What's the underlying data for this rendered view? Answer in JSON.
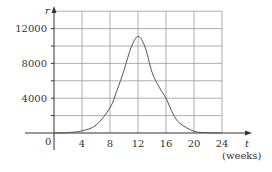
{
  "chart_data": {
    "type": "line",
    "title": "",
    "xlabel": "t",
    "xlabel_unit": "(weeks)",
    "ylabel": "r",
    "xlim": [
      0,
      24
    ],
    "ylim": [
      0,
      14000
    ],
    "x_ticks": [
      4,
      8,
      12,
      16,
      20,
      24
    ],
    "x_tick_labels": [
      "4",
      "8",
      "12",
      "16",
      "20",
      "24"
    ],
    "y_ticks": [
      4000,
      8000,
      12000
    ],
    "y_tick_labels": [
      "4000",
      "8000",
      "12000"
    ],
    "origin_label": "0",
    "grid": {
      "on": true,
      "x_step": 4,
      "y_step": 2000
    },
    "legend": null,
    "series": [
      {
        "name": "r(t)",
        "x": [
          0,
          2,
          4,
          6,
          8,
          9,
          10,
          11,
          12,
          13,
          14,
          15,
          16,
          17,
          18,
          20,
          22,
          24
        ],
        "values": [
          0,
          50,
          250,
          900,
          2900,
          4900,
          7200,
          9800,
          11100,
          9900,
          7000,
          5300,
          4000,
          2200,
          1100,
          200,
          40,
          0
        ]
      }
    ]
  },
  "colors": {
    "axis": "#333333",
    "grid": "#9a9a9a",
    "curve": "#555555",
    "text": "#333333"
  }
}
